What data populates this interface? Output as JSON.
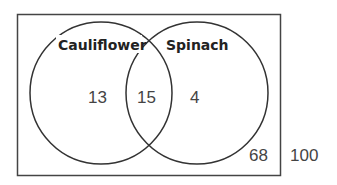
{
  "diagram": {
    "type": "venn",
    "universe_total": "100",
    "sets": [
      {
        "name": "Cauliflower",
        "only_count": "13"
      },
      {
        "name": "Spinach",
        "only_count": "4"
      }
    ],
    "intersection_count": "15",
    "outside_count": "68",
    "colors": {
      "stroke": "#333333",
      "text": "#444444",
      "label": "#222222"
    }
  }
}
